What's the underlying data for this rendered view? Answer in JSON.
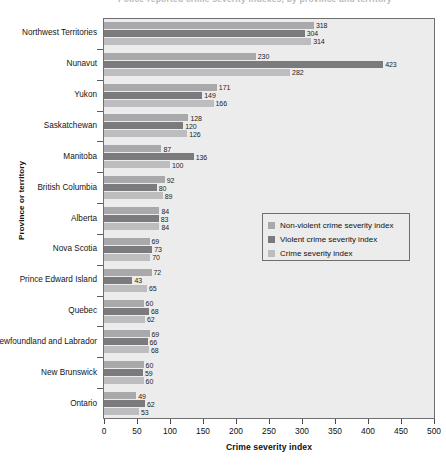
{
  "title": {
    "text": "Police-reported crime severity indexes, by province and territory"
  },
  "axes": {
    "y_title": "Province or territory",
    "x_title": "Crime severity index"
  },
  "legend": {
    "items": [
      {
        "label": "Non-violent crime severity index",
        "color": "#a9a9ab"
      },
      {
        "label": "Violent crime severity index",
        "color": "#7b7b7d"
      },
      {
        "label": "Crime severity index",
        "color": "#bdbdbf"
      }
    ]
  },
  "chart_data": {
    "type": "bar",
    "orientation": "horizontal",
    "title": "Police-reported crime severity indexes, by province and territory",
    "xlabel": "Crime severity index",
    "ylabel": "Province or territory",
    "xlim": [
      0,
      500
    ],
    "xticks": [
      0,
      50,
      100,
      150,
      200,
      250,
      300,
      350,
      400,
      450,
      500
    ],
    "grid": false,
    "legend_position": "middle-right-inside",
    "categories": [
      "Northwest Territories",
      "Nunavut",
      "Yukon",
      "Saskatchewan",
      "Manitoba",
      "British Columbia",
      "Alberta",
      "Nova Scotia",
      "Prince Edward Island",
      "Quebec",
      "Newfoundland and Labrador",
      "New Brunswick",
      "Ontario"
    ],
    "series": [
      {
        "name": "Non-violent crime severity index",
        "color": "#a9a9ab",
        "values": [
          318,
          230,
          171,
          128,
          87,
          92,
          84,
          69,
          72,
          60,
          69,
          60,
          49
        ]
      },
      {
        "name": "Violent crime severity index",
        "color": "#7b7b7d",
        "values": [
          304,
          423,
          149,
          120,
          136,
          80,
          83,
          73,
          43,
          68,
          66,
          59,
          62
        ]
      },
      {
        "name": "Crime severity index",
        "color": "#bdbdbf",
        "values": [
          314,
          282,
          166,
          126,
          100,
          89,
          84,
          70,
          65,
          62,
          68,
          60,
          53
        ]
      }
    ]
  }
}
